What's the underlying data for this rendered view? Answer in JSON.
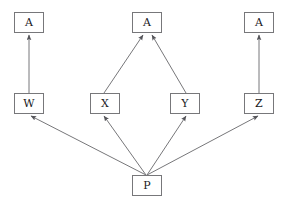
{
  "diagram": {
    "type": "directed-graph",
    "background_color": "#ffffff",
    "edge_color": "#77777a",
    "node_border_color": "#77777a",
    "node_fill_color": "#ffffff",
    "label_color": "#19191c",
    "canvas": {
      "width": 291,
      "height": 207
    },
    "node_size": {
      "width": 30,
      "height": 21
    },
    "nodes": [
      {
        "id": "a-left",
        "label": "A",
        "x": 14,
        "y": 12,
        "name": "node-a-left"
      },
      {
        "id": "a-middle",
        "label": "A",
        "x": 132,
        "y": 12,
        "name": "node-a-middle"
      },
      {
        "id": "a-right",
        "label": "A",
        "x": 244,
        "y": 12,
        "name": "node-a-right"
      },
      {
        "id": "w",
        "label": "W",
        "x": 14,
        "y": 93,
        "name": "node-w"
      },
      {
        "id": "x",
        "label": "X",
        "x": 90,
        "y": 93,
        "name": "node-x"
      },
      {
        "id": "y",
        "label": "Y",
        "x": 170,
        "y": 93,
        "name": "node-y"
      },
      {
        "id": "z",
        "label": "Z",
        "x": 244,
        "y": 93,
        "name": "node-z"
      },
      {
        "id": "p",
        "label": "P",
        "x": 132,
        "y": 175,
        "name": "node-p"
      }
    ],
    "edges": [
      {
        "id": "w-to-a",
        "from": "w",
        "to": "a-left",
        "x1": 29,
        "y1": 93,
        "x2": 29,
        "y2": 35,
        "name": "edge-w-to-a-left"
      },
      {
        "id": "x-to-a",
        "from": "x",
        "to": "a-middle",
        "x1": 104,
        "y1": 93,
        "x2": 143,
        "y2": 35,
        "name": "edge-x-to-a-middle"
      },
      {
        "id": "y-to-a",
        "from": "y",
        "to": "a-middle",
        "x1": 186,
        "y1": 93,
        "x2": 152,
        "y2": 35,
        "name": "edge-y-to-a-middle"
      },
      {
        "id": "z-to-a",
        "from": "z",
        "to": "a-right",
        "x1": 259,
        "y1": 93,
        "x2": 259,
        "y2": 35,
        "name": "edge-z-to-a-right"
      },
      {
        "id": "p-to-w",
        "from": "p",
        "to": "w",
        "x1": 146,
        "y1": 175,
        "x2": 31,
        "y2": 116,
        "name": "edge-p-to-w"
      },
      {
        "id": "p-to-x",
        "from": "p",
        "to": "x",
        "x1": 146,
        "y1": 175,
        "x2": 104,
        "y2": 116,
        "name": "edge-p-to-x"
      },
      {
        "id": "p-to-y",
        "from": "p",
        "to": "y",
        "x1": 147,
        "y1": 175,
        "x2": 186,
        "y2": 116,
        "name": "edge-p-to-y"
      },
      {
        "id": "p-to-z",
        "from": "p",
        "to": "z",
        "x1": 147,
        "y1": 175,
        "x2": 258,
        "y2": 116,
        "name": "edge-p-to-z"
      }
    ]
  }
}
